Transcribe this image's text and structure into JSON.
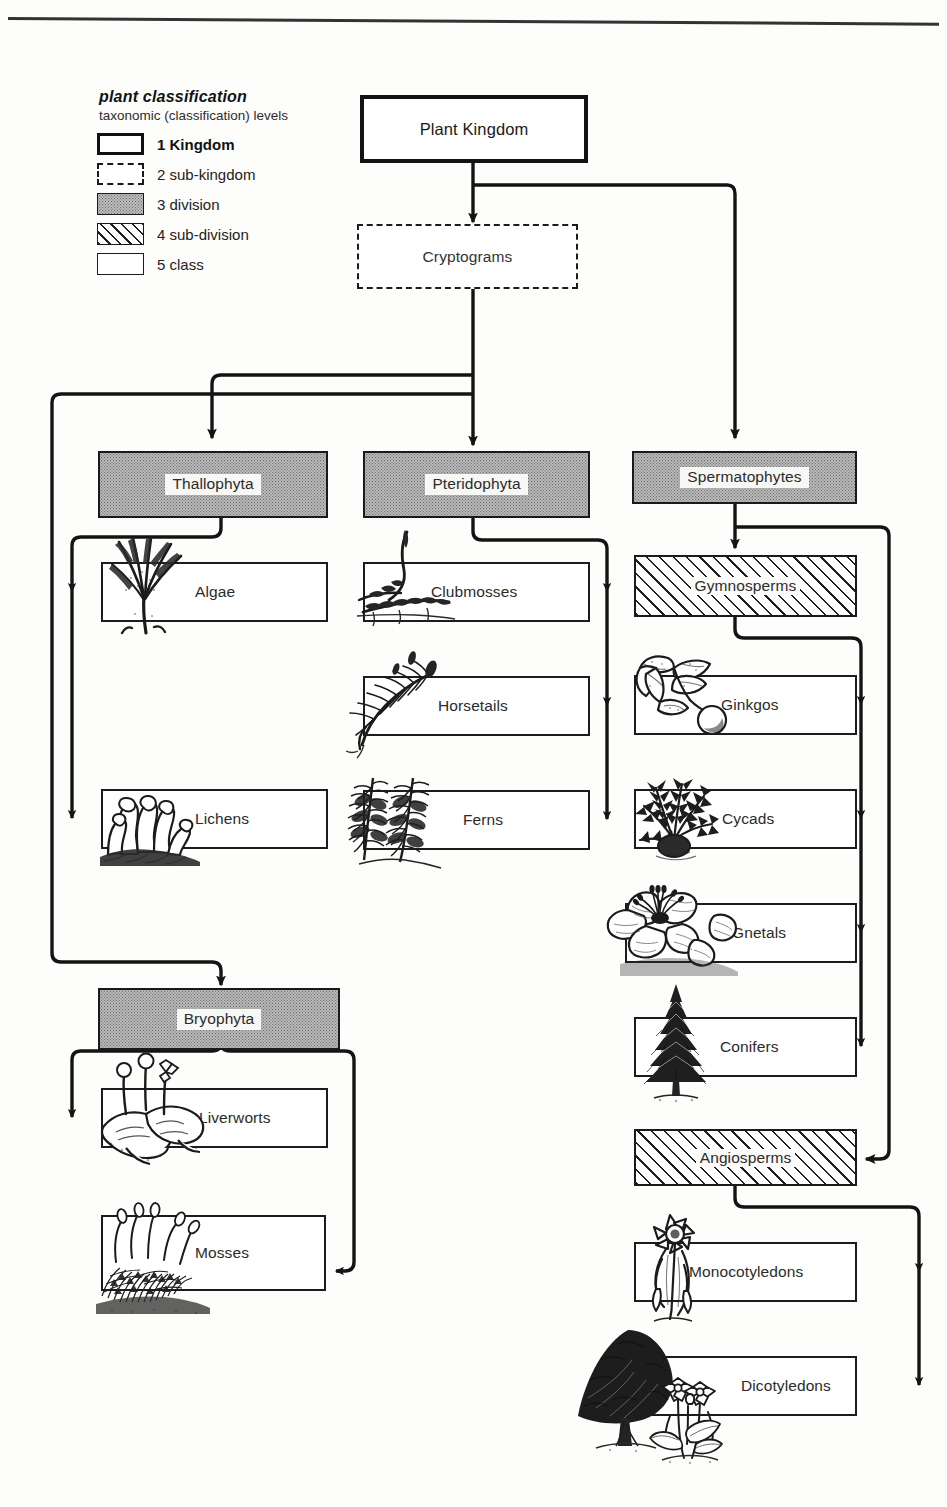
{
  "legend": {
    "title": "plant classification",
    "subtitle": "taxonomic (classification) levels",
    "items": [
      {
        "num": "1",
        "label": "Kingdom",
        "swatch": "solid-thick-box-swatch"
      },
      {
        "num": "2",
        "label": "sub-kingdom",
        "swatch": "dashed-box-swatch"
      },
      {
        "num": "3",
        "label": "division",
        "swatch": "grey-filled-box-swatch"
      },
      {
        "num": "4",
        "label": "sub-division",
        "swatch": "hatched-box-swatch"
      },
      {
        "num": "5",
        "label": "class",
        "swatch": "plain-box-swatch"
      }
    ]
  },
  "nodes": {
    "kingdom": {
      "label": "Plant Kingdom",
      "level": "1 Kingdom"
    },
    "cryptograms": {
      "label": "Cryptograms",
      "level": "2 sub-kingdom"
    },
    "thallophyta": {
      "label": "Thallophyta",
      "level": "3 division"
    },
    "pteridophyta": {
      "label": "Pteridophyta",
      "level": "3 division"
    },
    "spermatophytes": {
      "label": "Spermatophytes",
      "level": "3 division"
    },
    "bryophyta": {
      "label": "Bryophyta",
      "level": "3 division"
    },
    "gymnosperms": {
      "label": "Gymnosperms",
      "level": "4 sub-division"
    },
    "angiosperms": {
      "label": "Angiosperms",
      "level": "4 sub-division"
    },
    "algae": {
      "label": "Algae",
      "level": "5 class",
      "illustration": "seaweed-illustration"
    },
    "lichens": {
      "label": "Lichens",
      "level": "5 class",
      "illustration": "lichen-illustration"
    },
    "clubmosses": {
      "label": "Clubmosses",
      "level": "5 class",
      "illustration": "clubmoss-illustration"
    },
    "horsetails": {
      "label": "Horsetails",
      "level": "5 class",
      "illustration": "horsetail-illustration"
    },
    "ferns": {
      "label": "Ferns",
      "level": "5 class",
      "illustration": "fern-illustration"
    },
    "liverworts": {
      "label": "Liverworts",
      "level": "5 class",
      "illustration": "liverwort-illustration"
    },
    "mosses": {
      "label": "Mosses",
      "level": "5 class",
      "illustration": "moss-illustration"
    },
    "ginkgos": {
      "label": "Ginkgos",
      "level": "5 class",
      "illustration": "ginkgo-illustration"
    },
    "cycads": {
      "label": "Cycads",
      "level": "5 class",
      "illustration": "cycad-illustration"
    },
    "gnetals": {
      "label": "Gnetals",
      "level": "5 class",
      "illustration": "gnetum-flower-illustration"
    },
    "conifers": {
      "label": "Conifers",
      "level": "5 class",
      "illustration": "conifer-tree-illustration"
    },
    "monocotyledons": {
      "label": "Monocotyledons",
      "level": "5 class",
      "illustration": "daffodil-illustration"
    },
    "dicotyledons": {
      "label": "Dicotyledons",
      "level": "5 class",
      "illustration": "broadleaf-tree-illustration"
    }
  },
  "hierarchy": [
    {
      "parent": "kingdom",
      "children": [
        "cryptograms",
        "spermatophytes"
      ]
    },
    {
      "parent": "cryptograms",
      "children": [
        "thallophyta",
        "pteridophyta",
        "bryophyta"
      ]
    },
    {
      "parent": "thallophyta",
      "children": [
        "algae",
        "lichens"
      ]
    },
    {
      "parent": "pteridophyta",
      "children": [
        "clubmosses",
        "horsetails",
        "ferns"
      ]
    },
    {
      "parent": "bryophyta",
      "children": [
        "liverworts",
        "mosses"
      ]
    },
    {
      "parent": "spermatophytes",
      "children": [
        "gymnosperms",
        "angiosperms"
      ]
    },
    {
      "parent": "gymnosperms",
      "children": [
        "ginkgos",
        "cycads",
        "gnetals",
        "conifers"
      ]
    },
    {
      "parent": "angiosperms",
      "children": [
        "monocotyledons",
        "dicotyledons"
      ]
    }
  ],
  "colors": {
    "ink": "#1a1a1a",
    "paper": "#fdfdfb",
    "division_fill": "#b9b9b9",
    "hatch": "#1f1f1f"
  }
}
